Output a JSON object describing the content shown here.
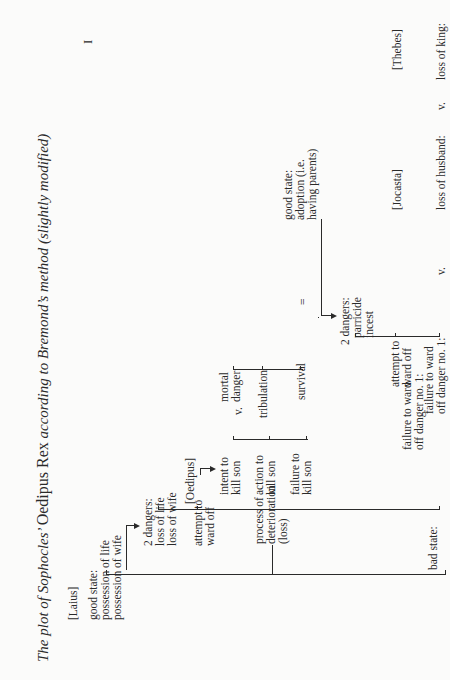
{
  "page": {
    "number": "I",
    "title_italic_pre": "The plot of Sophocles’ ",
    "title_roman": "Oedipus Rex",
    "title_italic_post": " according to Bremond’s method (slightly modified)"
  },
  "characters": {
    "laius": "[Laius]",
    "oedipus": "[Oedipus]",
    "jocasta": "[Jocasta]",
    "thebes": "[Thebes]"
  },
  "laius": {
    "good_state": [
      "good state:",
      "possession of life",
      "possession of wife"
    ],
    "dangers": [
      "2 dangers:",
      "loss of life",
      "loss of wife"
    ],
    "attempt": [
      "attempt to",
      "ward off"
    ],
    "intent": [
      "intent to",
      "kill son"
    ],
    "action": [
      "action to",
      "kill son"
    ],
    "failure_kill": [
      "failure to",
      "kill son"
    ],
    "failure_ward": [
      "failure to ward",
      "off danger no. 1:"
    ],
    "process": [
      "process of",
      "deterioration",
      "(loss)"
    ],
    "bad_state": [
      "bad state:",
      "..."
    ]
  },
  "oedipus": {
    "versus": "v.",
    "mortal_danger": [
      "mortal",
      "danger"
    ],
    "tribulation": "tribulation",
    "survival": "survival",
    "equals": "=",
    "good_state": [
      "good state:",
      "adoption (i.e.",
      "having parents)"
    ],
    "dangers": [
      "2 dangers:",
      "parricide",
      "incest"
    ],
    "attempt": [
      "attempt to",
      "ward off"
    ],
    "failure_ward": [
      "failure to ward",
      "off danger no. 1:"
    ]
  },
  "bottom_row": {
    "v1": "v.",
    "loss_of_husband": "loss of husband:",
    "v2": "v.",
    "loss_of_king": "loss of king:",
    "equals": "="
  }
}
